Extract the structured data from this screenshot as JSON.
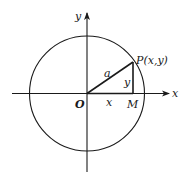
{
  "diagram": {
    "type": "unit-circle-coordinate",
    "colors": {
      "stroke": "#1a1a1a",
      "background": "#ffffff"
    },
    "axes": {
      "x_label": "x",
      "y_label": "y"
    },
    "points": {
      "origin": "O",
      "point": "P(x,y)",
      "foot": "M"
    },
    "segments": {
      "radius_label": "a",
      "horizontal_label": "x",
      "vertical_label": "y"
    }
  }
}
